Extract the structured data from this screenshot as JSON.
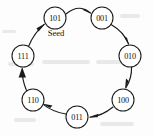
{
  "figure": {
    "background_color": "#fdfdfd",
    "stroke_color": "#1a1a1a",
    "node_fill": "#ffffff"
  },
  "seed": {
    "label": "Seed",
    "node": "101"
  },
  "nodes": [
    {
      "id": "n101",
      "label": "101",
      "cx": 55,
      "cy": 18,
      "r": 11
    },
    {
      "id": "n001",
      "label": "001",
      "cx": 102,
      "cy": 18,
      "r": 11
    },
    {
      "id": "n010",
      "label": "010",
      "cx": 130,
      "cy": 56,
      "r": 11
    },
    {
      "id": "n100",
      "label": "100",
      "cx": 123,
      "cy": 100,
      "r": 11
    },
    {
      "id": "n011",
      "label": "011",
      "cx": 77,
      "cy": 117,
      "r": 11
    },
    {
      "id": "n110",
      "label": "110",
      "cx": 33,
      "cy": 100,
      "r": 11
    },
    {
      "id": "n111",
      "label": "111",
      "cx": 23,
      "cy": 56,
      "r": 11
    }
  ],
  "edges": [
    {
      "from": "101",
      "to": "001",
      "direction": "clockwise"
    },
    {
      "from": "001",
      "to": "010",
      "direction": "clockwise"
    },
    {
      "from": "010",
      "to": "100",
      "direction": "clockwise"
    },
    {
      "from": "100",
      "to": "011",
      "direction": "clockwise"
    },
    {
      "from": "011",
      "to": "110",
      "direction": "clockwise"
    },
    {
      "from": "110",
      "to": "111",
      "direction": "clockwise"
    },
    {
      "from": "111",
      "to": "101",
      "direction": "clockwise"
    }
  ]
}
